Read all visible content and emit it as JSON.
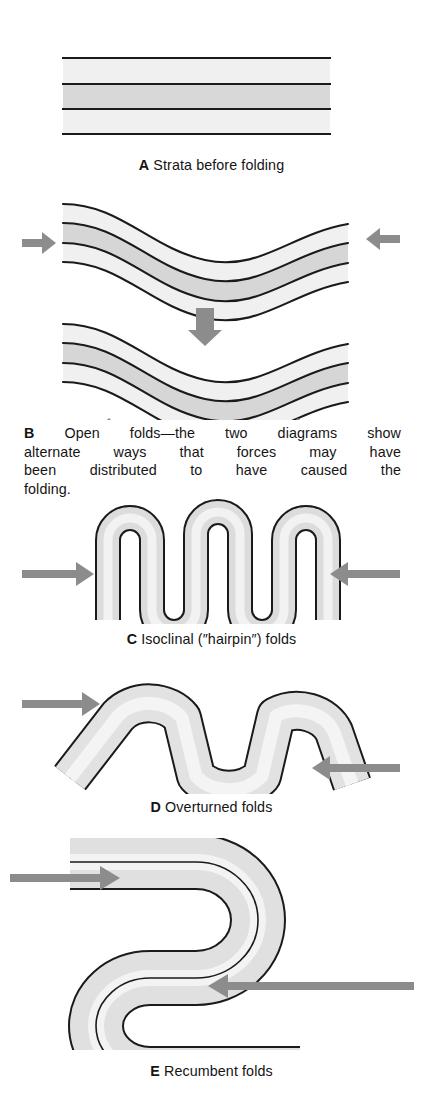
{
  "figure": {
    "background": "#ffffff"
  },
  "colors": {
    "band_light": "#f0f0f0",
    "band_mid": "#e4e4e4",
    "band_dark": "#d2d2d2",
    "stroke": "#1a1a1a",
    "arrow": "#8c8c8c",
    "text": "#141414"
  },
  "panels": [
    {
      "id": "A",
      "label": "A",
      "caption": "Strata before folding",
      "diagram": "horizontal-strata",
      "bands": 3,
      "arrows": []
    },
    {
      "id": "B",
      "label": "B",
      "caption_lines": [
        "Open folds—the two diagrams show",
        "alternate ways that forces may have",
        "been distributed to have caused the",
        "folding."
      ],
      "caption": "Open folds—the two diagrams show alternate ways that forces may have been distributed to have caused the folding.",
      "diagram": "open-folds",
      "sub_diagrams": 2,
      "bands": 3,
      "arrows": [
        {
          "direction": "right",
          "position": "left-middle",
          "diagram": 1
        },
        {
          "direction": "left",
          "position": "right-middle",
          "diagram": 1
        },
        {
          "direction": "down",
          "position": "top-center",
          "diagram": 2
        },
        {
          "direction": "up",
          "position": "bottom-left",
          "diagram": 2
        },
        {
          "direction": "up",
          "position": "bottom-right",
          "diagram": 2
        }
      ]
    },
    {
      "id": "C",
      "label": "C",
      "caption": "Isoclinal (″hairpin″) folds",
      "diagram": "isoclinal-folds",
      "bands": 1,
      "hinges": 5,
      "arrows": [
        {
          "direction": "right",
          "position": "left-middle"
        },
        {
          "direction": "left",
          "position": "right-middle"
        }
      ]
    },
    {
      "id": "D",
      "label": "D",
      "caption": "Overturned folds",
      "diagram": "overturned-folds",
      "bands": 2,
      "arrows": [
        {
          "direction": "right",
          "position": "upper-left"
        },
        {
          "direction": "left",
          "position": "lower-right"
        }
      ]
    },
    {
      "id": "E",
      "label": "E",
      "caption": "Recumbent folds",
      "diagram": "recumbent-folds",
      "bands": 3,
      "arrows": [
        {
          "direction": "right",
          "position": "upper-left"
        },
        {
          "direction": "left",
          "position": "lower-right"
        }
      ]
    }
  ]
}
